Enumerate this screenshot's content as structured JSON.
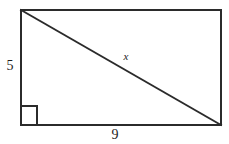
{
  "figure": {
    "type": "geometry-diagram",
    "shape": "rectangle-with-diagonal",
    "stroke_color": "#2b2b2b",
    "background_color": "#ffffff",
    "labels": {
      "height": "5",
      "base": "9",
      "diagonal": "x"
    },
    "markers": {
      "right_angle": "right-angle-square"
    },
    "geometry": {
      "rect_left": 21,
      "rect_top": 10,
      "rect_right": 221,
      "rect_bottom": 125,
      "diagonal_from": [
        21,
        10
      ],
      "diagonal_to": [
        221,
        125
      ],
      "right_angle_square": [
        21,
        106,
        16,
        19
      ]
    }
  }
}
